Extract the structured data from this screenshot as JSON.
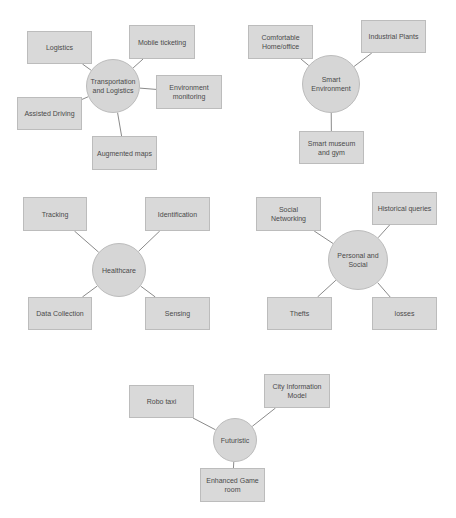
{
  "diagram": {
    "type": "mind-map",
    "colors": {
      "node_fill": "#d9d9d9",
      "node_border": "#bcbcbc",
      "edge": "#8a8a8a",
      "text": "#4a4a4a"
    },
    "clusters": [
      {
        "hub": {
          "label": "Transportation and Logistics",
          "cx": 113,
          "cy": 86,
          "r": 27
        },
        "children": [
          {
            "label": "Logistics",
            "x": 27,
            "y": 31,
            "w": 65,
            "h": 33
          },
          {
            "label": "Mobile ticketing",
            "x": 129,
            "y": 25,
            "w": 66,
            "h": 34
          },
          {
            "label": "Environment monitoring",
            "x": 156,
            "y": 75,
            "w": 66,
            "h": 34
          },
          {
            "label": "Assisted Driving",
            "x": 17,
            "y": 97,
            "w": 65,
            "h": 33
          },
          {
            "label": "Augmented maps",
            "x": 92,
            "y": 136,
            "w": 65,
            "h": 34
          }
        ]
      },
      {
        "hub": {
          "label": "Smart Environment",
          "cx": 331,
          "cy": 84,
          "r": 29
        },
        "children": [
          {
            "label": "Comfortable Home/office",
            "x": 248,
            "y": 25,
            "w": 65,
            "h": 34
          },
          {
            "label": "Industrial Plants",
            "x": 361,
            "y": 20,
            "w": 65,
            "h": 33
          },
          {
            "label": "Smart museum and gym",
            "x": 299,
            "y": 131,
            "w": 65,
            "h": 33
          }
        ]
      },
      {
        "hub": {
          "label": "Healthcare",
          "cx": 119,
          "cy": 270,
          "r": 27
        },
        "children": [
          {
            "label": "Tracking",
            "x": 23,
            "y": 197,
            "w": 64,
            "h": 34
          },
          {
            "label": "Identification",
            "x": 145,
            "y": 197,
            "w": 65,
            "h": 34
          },
          {
            "label": "Data Collection",
            "x": 28,
            "y": 297,
            "w": 64,
            "h": 33
          },
          {
            "label": "Sensing",
            "x": 145,
            "y": 297,
            "w": 65,
            "h": 33
          }
        ]
      },
      {
        "hub": {
          "label": "Personal and Social",
          "cx": 358,
          "cy": 260,
          "r": 30
        },
        "children": [
          {
            "label": "Social Networking",
            "x": 256,
            "y": 197,
            "w": 65,
            "h": 34
          },
          {
            "label": "Historical queries",
            "x": 372,
            "y": 192,
            "w": 65,
            "h": 33
          },
          {
            "label": "Thefts",
            "x": 267,
            "y": 297,
            "w": 65,
            "h": 33
          },
          {
            "label": "losses",
            "x": 372,
            "y": 297,
            "w": 65,
            "h": 33
          }
        ]
      },
      {
        "hub": {
          "label": "Futuristic",
          "cx": 235,
          "cy": 440,
          "r": 22
        },
        "children": [
          {
            "label": "Robo taxi",
            "x": 129,
            "y": 385,
            "w": 65,
            "h": 33
          },
          {
            "label": "City Information Model",
            "x": 264,
            "y": 374,
            "w": 66,
            "h": 34
          },
          {
            "label": "Enhanced Game room",
            "x": 200,
            "y": 468,
            "w": 65,
            "h": 34
          }
        ]
      }
    ]
  }
}
